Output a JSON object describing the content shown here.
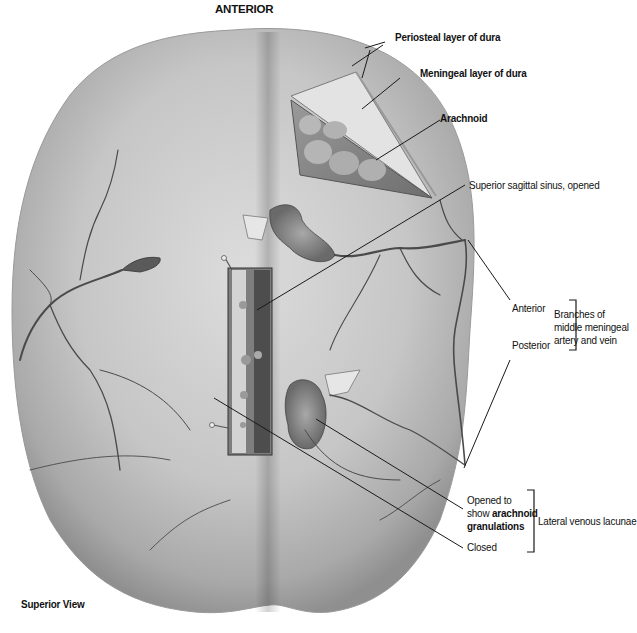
{
  "figure": {
    "orientation_top": "ANTERIOR",
    "view": "Superior View"
  },
  "labels": {
    "periosteal": "Periosteal layer of dura",
    "meningeal": "Meningeal layer of dura",
    "arachnoid": "Arachnoid",
    "sinus": "Superior sagittal sinus, opened",
    "anterior": "Anterior",
    "posterior": "Posterior",
    "branches_line1": "Branches of",
    "branches_line2": "middle meningeal",
    "branches_line3": "artery and vein",
    "opened_line1": "Opened to",
    "opened_line2_prefix": "show ",
    "opened_line2_bold": "arachnoid",
    "opened_line3_bold": "granulations",
    "closed": "Closed",
    "lacunae": "Lateral venous lacunae"
  },
  "colors": {
    "background": "#ffffff",
    "dura_light": "#d9d9d9",
    "dura_mid": "#b8b8b8",
    "dura_dark": "#8e8e8e",
    "vessel": "#4a4a4a",
    "leader_line": "#1a1a1a",
    "text": "#111111"
  }
}
